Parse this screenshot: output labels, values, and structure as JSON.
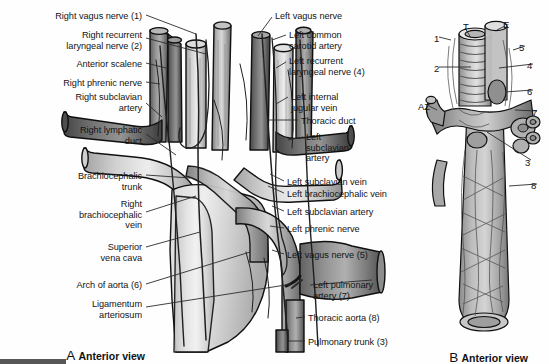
{
  "figure": {
    "type": "anatomical-illustration",
    "style": "grayscale-line-drawing",
    "width": 549,
    "height": 364
  },
  "panel_a": {
    "caption_letter": "A",
    "caption_text": "Anterior view",
    "labels_left": [
      {
        "id": "right-vagus-nerve",
        "text": "Right vagus nerve (1)",
        "x": 142,
        "y": 11,
        "align": "right"
      },
      {
        "id": "right-recurrent-laryngeal",
        "text": "Right recurrent\nlaryngeal nerve (2)",
        "x": 142,
        "y": 30,
        "align": "right"
      },
      {
        "id": "anterior-scalene",
        "text": "Anterior scalene",
        "x": 142,
        "y": 59,
        "align": "right"
      },
      {
        "id": "right-phrenic-nerve",
        "text": "Right phrenic nerve",
        "x": 142,
        "y": 78,
        "align": "right"
      },
      {
        "id": "right-subclavian-artery",
        "text": "Right subclavian\nartery",
        "x": 142,
        "y": 92,
        "align": "right"
      },
      {
        "id": "right-lymphatic-duct",
        "text": "Right lymphatic\nduct",
        "x": 142,
        "y": 125,
        "align": "right"
      },
      {
        "id": "brachiocephalic-trunk",
        "text": "Brachiocephalic\ntrunk",
        "x": 142,
        "y": 171,
        "align": "right"
      },
      {
        "id": "right-brachiocephalic-vein",
        "text": "Right\nbrachiocephalic\nvein",
        "x": 142,
        "y": 199,
        "align": "right"
      },
      {
        "id": "superior-vena-cava",
        "text": "Superior\nvena cava",
        "x": 142,
        "y": 242,
        "align": "right"
      },
      {
        "id": "arch-of-aorta",
        "text": "Arch of aorta (6)",
        "x": 142,
        "y": 280,
        "align": "right"
      },
      {
        "id": "ligamentum-arteriosum",
        "text": "Ligamentum\narteriosum",
        "x": 142,
        "y": 299,
        "align": "right"
      }
    ],
    "labels_right": [
      {
        "id": "left-vagus-nerve",
        "text": "Left vagus nerve",
        "x": 275,
        "y": 11,
        "align": "left"
      },
      {
        "id": "left-common-carotid-artery",
        "text": "Left common\ncarotid artery",
        "x": 289,
        "y": 30,
        "align": "left"
      },
      {
        "id": "left-recurrent-laryngeal",
        "text": "Left recurrent\nlaryngeal nerve (4)",
        "x": 289,
        "y": 56,
        "align": "left"
      },
      {
        "id": "left-internal-jugular-vein",
        "text": "Left internal\njugular vein",
        "x": 291,
        "y": 92,
        "align": "left"
      },
      {
        "id": "thoracic-duct",
        "text": "Thoracic duct",
        "x": 301,
        "y": 116,
        "align": "left"
      },
      {
        "id": "left-subclavian-artery-b",
        "text": "Left\nsubclavian\nartery",
        "x": 306,
        "y": 132,
        "align": "left"
      },
      {
        "id": "left-subclavian-vein",
        "text": "Left subclavian vein",
        "x": 287,
        "y": 177,
        "align": "left"
      },
      {
        "id": "left-brachiocephalic-vein",
        "text": "Left brachiocephalic vein",
        "x": 287,
        "y": 189,
        "align": "left"
      },
      {
        "id": "left-subclavian-artery",
        "text": "Left subclavian artery",
        "x": 287,
        "y": 207,
        "align": "left"
      },
      {
        "id": "left-phrenic-nerve",
        "text": "Left phrenic nerve",
        "x": 287,
        "y": 224,
        "align": "left"
      },
      {
        "id": "left-vagus-nerve-5",
        "text": "Left vagus nerve (5)",
        "x": 287,
        "y": 250,
        "align": "left"
      },
      {
        "id": "left-pulmonary-artery",
        "text": "Left pulmonary\nartery (7)",
        "x": 313,
        "y": 280,
        "align": "left"
      },
      {
        "id": "thoracic-aorta",
        "text": "Thoracic aorta (8)",
        "x": 308,
        "y": 313,
        "align": "left"
      },
      {
        "id": "pulmonary-trunk",
        "text": "Pulmonary trunk (3)",
        "x": 308,
        "y": 337,
        "align": "left"
      }
    ]
  },
  "panel_b": {
    "caption_letter": "B",
    "caption_text": "Anterior view",
    "labels": [
      {
        "id": "trachea",
        "text": "T",
        "x": 463,
        "y": 21
      },
      {
        "id": "esophagus",
        "text": "E",
        "x": 503,
        "y": 19
      },
      {
        "id": "num-1",
        "text": "1",
        "x": 434,
        "y": 33
      },
      {
        "id": "num-5",
        "text": "5",
        "x": 519,
        "y": 42
      },
      {
        "id": "num-2",
        "text": "2",
        "x": 434,
        "y": 63
      },
      {
        "id": "num-4",
        "text": "4",
        "x": 527,
        "y": 60
      },
      {
        "id": "num-6",
        "text": "6",
        "x": 527,
        "y": 86
      },
      {
        "id": "azygos",
        "text": "AZ",
        "x": 418,
        "y": 101
      },
      {
        "id": "num-7",
        "text": "7",
        "x": 532,
        "y": 107
      },
      {
        "id": "num-3",
        "text": "3",
        "x": 525,
        "y": 157
      },
      {
        "id": "num-8",
        "text": "8",
        "x": 531,
        "y": 180
      }
    ]
  },
  "key": {
    "1": "Right vagus nerve",
    "2": "Right recurrent laryngeal nerve",
    "3": "Pulmonary trunk",
    "4": "Left recurrent laryngeal nerve",
    "5": "Left vagus nerve",
    "6": "Arch of aorta",
    "7": "Left pulmonary artery",
    "8": "Thoracic aorta",
    "T": "Trachea",
    "E": "Esophagus",
    "AZ": "Azygos vein"
  },
  "colors": {
    "ink": "#141414",
    "leader": "#2b2b2b",
    "artery": "#9a9a9a",
    "vein": "#cfcfcf",
    "background": "#ffffff"
  }
}
